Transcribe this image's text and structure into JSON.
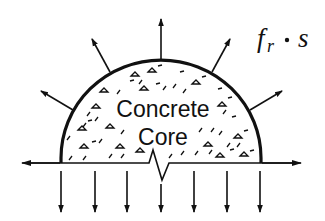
{
  "diagram": {
    "title_label": {
      "f": "f",
      "subscript": "r",
      "dot": "•",
      "s": "s"
    },
    "core_label": {
      "line1": "Concrete",
      "line2": "Core"
    },
    "colors": {
      "ink": "#111111",
      "background": "#ffffff"
    },
    "elements": {
      "semicircle": "concrete core cross-section (half)",
      "radial_arrows": 5,
      "downward_arrows": 7,
      "horizontal_arrows": 2,
      "notch": "crack/break symbol at baseline center"
    }
  }
}
